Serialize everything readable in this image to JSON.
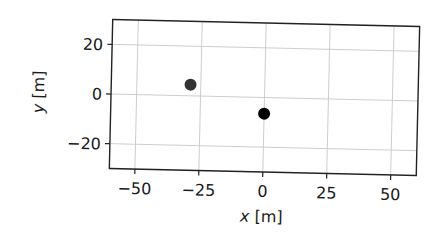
{
  "chart_data": {
    "type": "scatter",
    "title": "",
    "xlabel": "x [m]",
    "ylabel": "y [m]",
    "xlim": [
      -60,
      60
    ],
    "ylim": [
      -30,
      30
    ],
    "xticks": [
      -50,
      -25,
      0,
      25,
      50
    ],
    "yticks": [
      -20,
      0,
      20
    ],
    "xtick_labels": [
      "−50",
      "−25",
      "0",
      "25",
      "50"
    ],
    "ytick_labels": [
      "−20",
      "0",
      "20"
    ],
    "grid": true,
    "legend": null,
    "points": [
      {
        "x": -29,
        "y": 4.5,
        "color": "#333333"
      },
      {
        "x": 0,
        "y": -6.5,
        "color": "#000000"
      }
    ]
  }
}
